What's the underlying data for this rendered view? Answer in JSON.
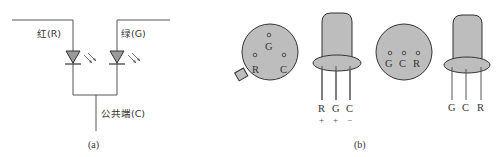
{
  "panel_a": {
    "caption": "(a)",
    "label_red": "红(R)",
    "label_green": "绿(G)",
    "label_common": "公共端(C)"
  },
  "panel_b": {
    "caption": "(b)",
    "view1_top": {
      "pins": [
        "G",
        "R",
        "C"
      ]
    },
    "view1_side": {
      "pins": [
        "R",
        "G",
        "C"
      ],
      "polarity": [
        "+",
        "+",
        "−"
      ]
    },
    "view2_top": {
      "pins": [
        "G",
        "C",
        "R"
      ]
    },
    "view2_side": {
      "pins": [
        "G",
        "C",
        "R"
      ]
    }
  },
  "colors": {
    "fill": "#bdbdbd",
    "stroke": "#333333",
    "wire": "#555555"
  }
}
